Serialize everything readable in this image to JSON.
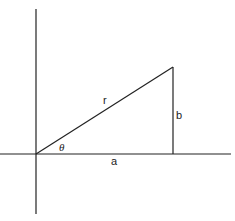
{
  "diagram": {
    "type": "right-triangle-polar",
    "colors": {
      "line": "#222222",
      "background": "#ffffff"
    },
    "axes": {
      "horizontal": {
        "x1": 0,
        "y1": 154,
        "x2": 231,
        "y2": 154
      },
      "vertical": {
        "x1": 36,
        "y1": 9,
        "x2": 36,
        "y2": 214
      }
    },
    "triangle": {
      "origin": {
        "x": 36,
        "y": 154
      },
      "corner": {
        "x": 173,
        "y": 154
      },
      "apex": {
        "x": 173,
        "y": 67
      }
    },
    "labels": {
      "hypotenuse": "r",
      "opposite": "b",
      "adjacent": "a",
      "angle": "θ"
    }
  }
}
